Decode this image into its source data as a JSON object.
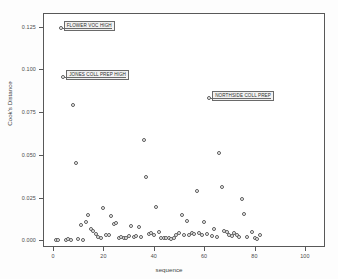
{
  "chart_data": {
    "type": "scatter",
    "title": "",
    "xlabel": "sequence",
    "ylabel": "Cook's Distance",
    "xlim": [
      -4,
      108
    ],
    "ylim": [
      -0.004,
      0.133
    ],
    "xticks": [
      0,
      20,
      40,
      60,
      80,
      100
    ],
    "xticklabels": [
      "0",
      "20",
      "40",
      "60",
      "80",
      "100"
    ],
    "yticks": [
      0.0,
      0.025,
      0.05,
      0.075,
      0.1,
      0.125
    ],
    "yticklabels": [
      "0.000",
      "0.025",
      "0.050",
      "0.075",
      "0.100",
      "0.125"
    ],
    "grid": false,
    "legend": null,
    "marker": "open-circle",
    "series": [
      {
        "name": "Cook's Distance",
        "points": [
          [
            1,
            0.0003
          ],
          [
            2,
            0.0004
          ],
          [
            3,
            0.1243
          ],
          [
            4,
            0.0955
          ],
          [
            5,
            0.0004
          ],
          [
            6,
            0.0005
          ],
          [
            7,
            0.0003
          ],
          [
            8,
            0.0793
          ],
          [
            9,
            0.0455
          ],
          [
            10,
            0.0006
          ],
          [
            11,
            0.0091
          ],
          [
            12,
            0.0003
          ],
          [
            13,
            0.0104
          ],
          [
            14,
            0.0148
          ],
          [
            15,
            0.0063
          ],
          [
            16,
            0.0056
          ],
          [
            17,
            0.0039
          ],
          [
            18,
            0.0017
          ],
          [
            19,
            0.0014
          ],
          [
            20,
            0.0187
          ],
          [
            21,
            0.0031
          ],
          [
            22,
            0.0028
          ],
          [
            23,
            0.0142
          ],
          [
            24,
            0.0095
          ],
          [
            25,
            0.0098
          ],
          [
            26,
            0.0013
          ],
          [
            27,
            0.0018
          ],
          [
            28,
            0.0011
          ],
          [
            29,
            0.0015
          ],
          [
            30,
            0.0025
          ],
          [
            31,
            0.0086
          ],
          [
            32,
            0.0018
          ],
          [
            33,
            0.0022
          ],
          [
            34,
            0.0079
          ],
          [
            35,
            0.0019
          ],
          [
            36,
            0.0584
          ],
          [
            37,
            0.0372
          ],
          [
            38,
            0.0035
          ],
          [
            39,
            0.004
          ],
          [
            40,
            0.0031
          ],
          [
            41,
            0.0192
          ],
          [
            42,
            0.0047
          ],
          [
            43,
            0.0013
          ],
          [
            44,
            0.0014
          ],
          [
            45,
            0.0012
          ],
          [
            46,
            0.0011
          ],
          [
            47,
            0.001
          ],
          [
            48,
            0.0013
          ],
          [
            49,
            0.0032
          ],
          [
            50,
            0.0042
          ],
          [
            51,
            0.0148
          ],
          [
            52,
            0.003
          ],
          [
            53,
            0.011
          ],
          [
            54,
            0.0028
          ],
          [
            55,
            0.0041
          ],
          [
            56,
            0.0038
          ],
          [
            57,
            0.029
          ],
          [
            58,
            0.0042
          ],
          [
            59,
            0.0033
          ],
          [
            60,
            0.0107
          ],
          [
            61,
            0.0035
          ],
          [
            62,
            0.0832
          ],
          [
            63,
            0.0024
          ],
          [
            64,
            0.0063
          ],
          [
            65,
            0.0019
          ],
          [
            66,
            0.051
          ],
          [
            67,
            0.0313
          ],
          [
            68,
            0.0056
          ],
          [
            69,
            0.0051
          ],
          [
            70,
            0.0032
          ],
          [
            71,
            0.0026
          ],
          [
            72,
            0.0045
          ],
          [
            73,
            0.003
          ],
          [
            74,
            0.0016
          ],
          [
            75,
            0.0243
          ],
          [
            76,
            0.0153
          ],
          [
            77,
            0.002
          ],
          [
            78,
            0.0832
          ],
          [
            79,
            0.0046
          ],
          [
            80,
            0.0013
          ],
          [
            81,
            0.001
          ],
          [
            82,
            0.0029
          ]
        ]
      }
    ],
    "annotations": [
      {
        "text": "FLOWER VOC HIGH",
        "x": 3,
        "y": 0.1243
      },
      {
        "text": "JONES COLL PREP HIGH",
        "x": 4,
        "y": 0.0955
      },
      {
        "text": "NORTHSIDE COLL PREP",
        "x": 62,
        "y": 0.0832
      }
    ]
  }
}
